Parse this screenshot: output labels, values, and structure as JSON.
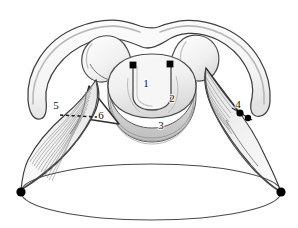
{
  "figure": {
    "background_color": "#ffffff",
    "outline_color": "#3a3a3a",
    "fill_light": "#f2f2f2",
    "fill_mid": "#e2e2e2",
    "fill_shadow": "#c9c9c9",
    "marker_color": "#000000",
    "label_color": "#111111"
  },
  "labels": [
    {
      "id": "label-1",
      "text": "1",
      "x": 146,
      "y": 87
    },
    {
      "id": "label-2",
      "text": "2",
      "x": 172,
      "y": 102
    },
    {
      "id": "label-3",
      "text": "3",
      "x": 161,
      "y": 129
    },
    {
      "id": "label-4",
      "text": "4",
      "x": 238,
      "y": 108
    },
    {
      "id": "label-5",
      "text": "5",
      "x": 56,
      "y": 109
    },
    {
      "id": "label-6",
      "text": "6",
      "x": 101,
      "y": 119
    }
  ],
  "markers": [
    {
      "id": "marker-left-vocal-process",
      "x": 133,
      "y": 65,
      "r": 3.4,
      "shape": "square"
    },
    {
      "id": "marker-right-vocal-process",
      "x": 170,
      "y": 64,
      "r": 3.4,
      "shape": "square"
    },
    {
      "id": "marker-right-joint-upper",
      "x": 240,
      "y": 113,
      "r": 3.6,
      "shape": "circle"
    },
    {
      "id": "marker-right-joint-lower",
      "x": 248,
      "y": 118,
      "r": 3.2,
      "shape": "circle"
    },
    {
      "id": "marker-left-base",
      "x": 21,
      "y": 192,
      "r": 4.6,
      "shape": "circle"
    },
    {
      "id": "marker-right-base",
      "x": 281,
      "y": 192,
      "r": 4.6,
      "shape": "circle"
    }
  ],
  "structures": {
    "outer_cartilage": "thyroid-cartilage-outline",
    "central_ring": "cricoid-ring",
    "left_muscle": "left-striated-muscle",
    "right_muscle": "right-striated-muscle",
    "triangle": "left-triangular-plate",
    "base_ellipse": "tracheal-ring-ellipse",
    "dotted_guide": "left-dashed-guide-line"
  }
}
